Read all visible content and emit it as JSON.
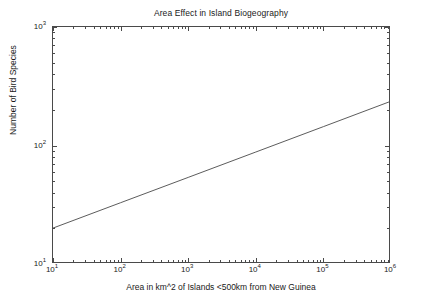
{
  "chart_data": {
    "type": "line",
    "title": "Area Effect in Island Biogeography",
    "xlabel": "Area in km^2 of Islands <500km from New Guinea",
    "ylabel": "Number of Bird Species",
    "xscale": "log",
    "yscale": "log",
    "xlim": [
      10,
      1000000
    ],
    "ylim": [
      10,
      1000
    ],
    "grid": false,
    "legend": null,
    "annotations": [],
    "xticks": [
      {
        "value": 10,
        "label": "10",
        "exponent": "1"
      },
      {
        "value": 100,
        "label": "10",
        "exponent": "2"
      },
      {
        "value": 1000,
        "label": "10",
        "exponent": "3"
      },
      {
        "value": 10000,
        "label": "10",
        "exponent": "4"
      },
      {
        "value": 100000,
        "label": "10",
        "exponent": "5"
      },
      {
        "value": 1000000,
        "label": "10",
        "exponent": "6"
      }
    ],
    "yticks": [
      {
        "value": 10,
        "label": "10",
        "exponent": "1"
      },
      {
        "value": 100,
        "label": "10",
        "exponent": "2"
      },
      {
        "value": 1000,
        "label": "10",
        "exponent": "3"
      }
    ],
    "series": [
      {
        "name": "Species-area relationship",
        "color": "#4a4a4a",
        "linewidth": 0.9,
        "x": [
          10,
          100,
          1000,
          10000,
          100000,
          1000000
        ],
        "y": [
          20.1,
          32.9,
          53.8,
          88.1,
          144.3,
          236.5
        ]
      }
    ],
    "fit": {
      "form": "S = c * A^z",
      "slope_z": 0.214,
      "intercept_log10c": 1.304
    }
  }
}
